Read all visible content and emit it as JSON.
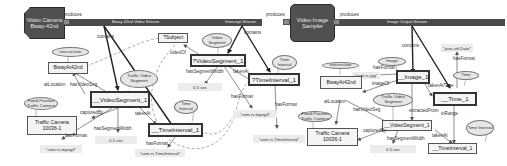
{
  "components": {
    "camera": {
      "label": "Video Camera Bway-42nd"
    },
    "sampler": {
      "label": "Video Image Sampler"
    }
  },
  "streams": {
    "s1": "Bway 42nd Video Stream",
    "s2": "Intercept Stream",
    "s3": "Image Output Stream"
  },
  "edge_labels": {
    "produces_1": "produces",
    "produces_2": "produces",
    "produces_3": "produces",
    "contains_1": "contains",
    "contains_2": "contains",
    "contains_3": "contains"
  },
  "panel1": {
    "ell_intersection": "intersection",
    "node_bway": "BwayAt42nd",
    "ell_fixed": "Fixed-Position Traffic Camera",
    "node_camera": "Traffic Camera 10036-1",
    "ell_tvs": "Traffic Video Segment",
    "node_vseg": "__VideoSegment_1",
    "ell_time": "Time Interval",
    "node_tint": "__TimeInterval_1",
    "lit_mpeg": "\"com.rs.mpeg4\"",
    "lit_len": "0.5 sec",
    "lit_tint": "\"com.rs.TimeInterval\"",
    "lbl_atLocation": "atLocation",
    "lbl_hasVideoSeg": "hasVideoSeg",
    "lbl_capturedBy": "capturedBy",
    "lbl_hasFormat1": "hasFormat",
    "lbl_hasSegmentWidth": "hasSegmentWidth",
    "lbl_takenAt": "takenAt",
    "lbl_hasFormat2": "hasFormat"
  },
  "panel2": {
    "node_subject": "?Subject",
    "ell_vseg": "Video Segment",
    "node_vseg": "?VideoSegment_1",
    "ell_time": "Time Interval",
    "node_tint": "?TimeInterval_1",
    "lit_len": "0.5 sec",
    "lit_mpeg": "\"com.rs.mpeg4\"",
    "lit_tint": "\"com.rs.TimeInterval\"",
    "lbl_videoOf": "videoOf",
    "lbl_hasSegmentWidth": "hasSegmentWidth",
    "lbl_takenAt": "takenAt",
    "lbl_hasFormat1": "hasFormat",
    "lbl_hasFormat2": "hasFormat"
  },
  "panel3": {
    "ell_image": "Image",
    "node_image": "__Image_1",
    "lit_jpg": "\"com.rs.jpg\"",
    "lit_date": "\"java.util.Date\"",
    "ell_time": "Time",
    "node_time": "__Time_1",
    "ell_intersection": "intersection",
    "node_bway": "BwayAt42nd",
    "ell_fixed": "Fixed-Position Traffic Camera",
    "node_camera": "Traffic Camera 10036-1",
    "ell_tvs": "Traffic Video Segment",
    "node_vseg": "__VideoSegment_1",
    "lit_len": "0.5 sec",
    "ell_tint": "Time Interval",
    "node_tint": "__TimeInterval_1",
    "lbl_hasFormat1": "hasFormat",
    "lbl_imageOf": "imageOf",
    "lbl_takenAtTime": "takenAtTime",
    "lbl_hasFormat2": "hasFormat",
    "lbl_atLocation": "atLocation",
    "lbl_hasVideoSeg": "hasVideoSeg",
    "lbl_extractedFrom": "extractedFrom",
    "lbl_capturedBy": "capturedBy",
    "lbl_hasSegmentWidth": "hasSegmentWidth",
    "lbl_takenAt": "takenAt",
    "lbl_inRange": "inRange"
  }
}
